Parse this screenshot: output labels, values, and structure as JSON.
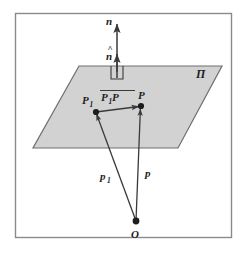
{
  "figure": {
    "background_color": "#ffffff",
    "frame_color": "#8a8a8a",
    "stroke_color": "#3a3a3a",
    "plane_fill_color": "#d2d2d2",
    "plane_edge_color": "#6e6e6e",
    "label_color": "#1d1d1d"
  },
  "labels": {
    "normal_vector": "n",
    "unit_normal": "n",
    "unit_normal_hat": "^",
    "plane": "Π",
    "point_p1_letter": "P",
    "point_p1_sub": "1",
    "point_p": "P",
    "inplane_vector_first": "P",
    "inplane_vector_first_sub": "1",
    "inplane_vector_second": "P",
    "position_p1_letter": "p",
    "position_p1_sub": "1",
    "position_p": "p",
    "origin": "O"
  },
  "geometry": {
    "frame": {
      "x": 15,
      "y": 13,
      "width": 217,
      "height": 225
    },
    "plane_polygon": "79,66 222,66 178,148 33,148",
    "normal_line": {
      "x": 117,
      "y_top": 22,
      "y_bottom": 78
    },
    "unit_normal_arrow_tip_y": 52,
    "right_angle_marker": {
      "x": 111,
      "y": 66,
      "size": 12
    },
    "point_p1": {
      "x": 96,
      "y": 112
    },
    "point_p": {
      "x": 141,
      "y": 106
    },
    "point_o": {
      "x": 136,
      "y": 221
    }
  }
}
